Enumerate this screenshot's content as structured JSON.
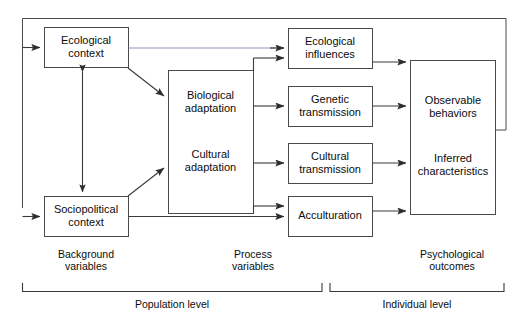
{
  "diagram": {
    "colors": {
      "stroke": "#3a3a3a",
      "text": "#0c0c0c",
      "highlight_line": "#8b92c8",
      "background": "#ffffff"
    },
    "boxes": {
      "ecological_context": {
        "label": "Ecological\ncontext",
        "x": 44,
        "y": 27,
        "w": 84,
        "h": 40
      },
      "sociopolitical_context": {
        "label": "Sociopolitical\ncontext",
        "x": 44,
        "y": 196,
        "w": 84,
        "h": 40
      },
      "adaptation": {
        "x": 168,
        "y": 70,
        "w": 85,
        "h": 143,
        "items": [
          {
            "label": "Biological\nadaptation"
          },
          {
            "label": "Cultural\nadaptation"
          }
        ]
      },
      "ecological_influences": {
        "label": "Ecological\ninfluences",
        "x": 288,
        "y": 28,
        "w": 84,
        "h": 40
      },
      "genetic_transmission": {
        "label": "Genetic\ntransmission",
        "x": 288,
        "y": 86,
        "w": 84,
        "h": 40
      },
      "cultural_transmission": {
        "label": "Cultural\ntransmission",
        "x": 288,
        "y": 143,
        "w": 84,
        "h": 40
      },
      "acculturation": {
        "label": "Acculturation",
        "x": 288,
        "y": 196,
        "w": 84,
        "h": 40
      },
      "psychological_outcomes": {
        "x": 410,
        "y": 60,
        "w": 85,
        "h": 154,
        "items": [
          {
            "label": "Observable\nbehaviors"
          },
          {
            "label": "Inferred\ncharacteristics"
          }
        ]
      }
    },
    "group_labels": [
      {
        "name": "background-variables",
        "label": "Background\nvariables",
        "cx": 86,
        "y": 250
      },
      {
        "name": "process-variables",
        "label": "Process\nvariables",
        "cx": 253,
        "y": 250
      },
      {
        "name": "psychological-outcomes",
        "label": "Psychological\noutcomes",
        "cx": 452,
        "y": 250
      }
    ],
    "level_brackets": [
      {
        "name": "population-level",
        "label": "Population level",
        "x1": 22,
        "x2": 322,
        "y": 291,
        "cx": 172,
        "label_y": 301
      },
      {
        "name": "individual-level",
        "label": "Individual level",
        "x1": 330,
        "x2": 504,
        "y": 291,
        "cx": 417,
        "label_y": 301
      }
    ]
  }
}
